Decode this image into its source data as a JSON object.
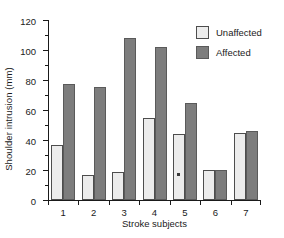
{
  "chart_data": {
    "type": "bar",
    "title": "",
    "xlabel": "Stroke subjects",
    "ylabel": "Shoulder intrusion (mm)",
    "categories": [
      "1",
      "2",
      "3",
      "4",
      "5",
      "6",
      "7"
    ],
    "series": [
      {
        "name": "Unaffected",
        "color": "#ececec",
        "values": [
          36.5,
          17,
          19,
          55,
          44,
          20,
          44.5
        ]
      },
      {
        "name": "Affected",
        "color": "#7d7d7d",
        "values": [
          77.5,
          75.5,
          108,
          102,
          65,
          20,
          46
        ]
      }
    ],
    "ylim": [
      0,
      120
    ],
    "yticks": [
      0,
      20,
      40,
      60,
      80,
      100,
      120
    ],
    "ytick_labels": [
      "0",
      "20",
      "40",
      "60",
      "80",
      "100",
      "120"
    ],
    "yticks_minor": [
      10,
      30,
      50,
      70,
      90,
      110
    ],
    "grid": false,
    "legend_position": "upper right",
    "annotations": [
      {
        "text": "*",
        "series": "Unaffected",
        "category": "5",
        "value": 17
      }
    ]
  },
  "legend": {
    "entries": [
      {
        "label": "Unaffected"
      },
      {
        "label": "Affected"
      }
    ]
  }
}
